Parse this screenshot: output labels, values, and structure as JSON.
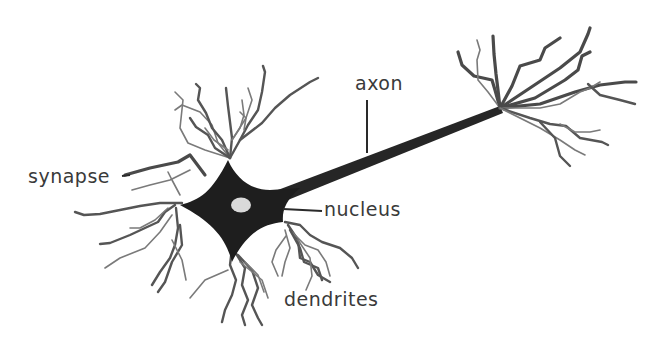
{
  "diagram": {
    "colors": {
      "background": "#ffffff",
      "soma": "#1e1e1e",
      "axon": "#262626",
      "nucleus": "#d9d9d9",
      "dendrite_dark": "#4a4a4a",
      "dendrite_light": "#7a7a7a",
      "label_text": "#3a3a3a"
    },
    "labels": {
      "synapse": "synapse",
      "axon": "axon",
      "nucleus": "nucleus",
      "dendrites": "dendrites"
    },
    "parts": [
      {
        "id": "soma",
        "name": "cell body"
      },
      {
        "id": "nucleus",
        "name": "nucleus"
      },
      {
        "id": "axon",
        "name": "axon"
      },
      {
        "id": "axon-terminal",
        "name": "axon terminal branches"
      },
      {
        "id": "dendrites",
        "name": "dendrites"
      },
      {
        "id": "synapse",
        "name": "synapse"
      }
    ]
  }
}
